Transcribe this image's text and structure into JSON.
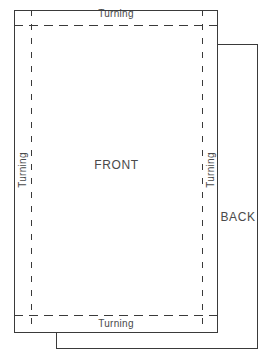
{
  "diagram": {
    "line_color": "#3a3a3a",
    "text_color": "#4a4a4a",
    "background_color": "#ffffff",
    "panels": [
      {
        "id": "front",
        "label": "FRONT",
        "edge_style": "solid",
        "x": 14,
        "y": 10,
        "width": 204,
        "height": 323
      },
      {
        "id": "back",
        "label": "BACK",
        "edge_style": "solid",
        "x": 56,
        "y": 44,
        "width": 202,
        "height": 305
      }
    ],
    "seam_allowance": {
      "style": "dashed",
      "x": 31,
      "y": 25,
      "width": 171,
      "height": 290
    },
    "labels": {
      "front": "FRONT",
      "back": "BACK",
      "turning_top": "Turning",
      "turning_bottom": "Turning",
      "turning_left": "Turning",
      "turning_right": "Turning"
    }
  }
}
